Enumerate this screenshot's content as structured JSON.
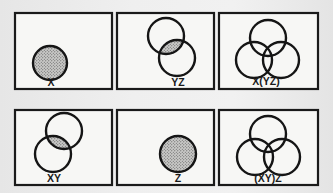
{
  "figure": {
    "colors": {
      "outline": "#151515",
      "shade": "#8a8a8a",
      "panel_bg": "#f7f7f5"
    },
    "panels": [
      {
        "id": "x",
        "label": "X",
        "row": 1,
        "col": 1,
        "box": {
          "x": 15,
          "y": 13,
          "w": 97,
          "h": 76
        },
        "circles": [
          {
            "set": "X",
            "cx": 50,
            "cy": 63,
            "r": 17
          }
        ],
        "shaded": "X",
        "label_pos": {
          "x": 51,
          "y": 86
        }
      },
      {
        "id": "yz",
        "label": "YZ",
        "row": 1,
        "col": 2,
        "box": {
          "x": 117,
          "y": 13,
          "w": 97,
          "h": 76
        },
        "circles": [
          {
            "set": "Y",
            "cx": 166,
            "cy": 36,
            "r": 18
          },
          {
            "set": "Z",
            "cx": 177,
            "cy": 58,
            "r": 18
          }
        ],
        "shaded": "Y∩Z",
        "label_pos": {
          "x": 178,
          "y": 86
        }
      },
      {
        "id": "x-yz",
        "label": "X(YZ)",
        "row": 1,
        "col": 3,
        "box": {
          "x": 219,
          "y": 13,
          "w": 99,
          "h": 76
        },
        "circles": [
          {
            "set": "Y",
            "cx": 268,
            "cy": 38,
            "r": 18
          },
          {
            "set": "X",
            "cx": 254,
            "cy": 60,
            "r": 18
          },
          {
            "set": "Z",
            "cx": 281,
            "cy": 60,
            "r": 18
          }
        ],
        "shaded": "none",
        "label_pos": {
          "x": 266,
          "y": 85
        }
      },
      {
        "id": "xy",
        "label": "XY",
        "row": 2,
        "col": 1,
        "box": {
          "x": 15,
          "y": 110,
          "w": 97,
          "h": 75
        },
        "circles": [
          {
            "set": "Y",
            "cx": 64,
            "cy": 131,
            "r": 18
          },
          {
            "set": "X",
            "cx": 53,
            "cy": 154,
            "r": 18
          }
        ],
        "shaded": "X∩Y",
        "label_pos": {
          "x": 54,
          "y": 182
        }
      },
      {
        "id": "z",
        "label": "Z",
        "row": 2,
        "col": 2,
        "box": {
          "x": 117,
          "y": 110,
          "w": 97,
          "h": 75
        },
        "circles": [
          {
            "set": "Z",
            "cx": 178,
            "cy": 154,
            "r": 18
          }
        ],
        "shaded": "Z",
        "label_pos": {
          "x": 178,
          "y": 182
        }
      },
      {
        "id": "xy-z",
        "label": "(XY)Z",
        "row": 2,
        "col": 3,
        "box": {
          "x": 219,
          "y": 110,
          "w": 99,
          "h": 75
        },
        "circles": [
          {
            "set": "Y",
            "cx": 268,
            "cy": 134,
            "r": 18
          },
          {
            "set": "X",
            "cx": 255,
            "cy": 157,
            "r": 18
          },
          {
            "set": "Z",
            "cx": 282,
            "cy": 157,
            "r": 18
          }
        ],
        "shaded": "none",
        "label_pos": {
          "x": 268,
          "y": 182
        }
      }
    ]
  }
}
